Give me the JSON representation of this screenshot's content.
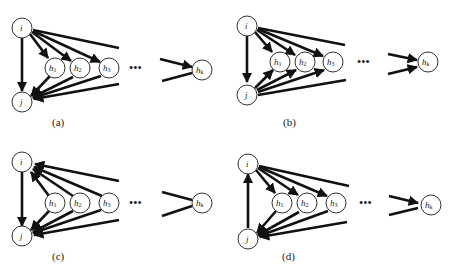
{
  "figure": {
    "panels": [
      {
        "id": "a",
        "caption": "(a)",
        "nodes": {
          "i": "i",
          "j": "j",
          "h1": "h",
          "h2": "h",
          "h3": "h",
          "hk": "h"
        },
        "subscripts": {
          "h1": "1",
          "h2": "2",
          "h3": "3",
          "hk": "k"
        },
        "ellipsis": "•••",
        "description": "i → j, i → h1..hk, h1..hk → j"
      },
      {
        "id": "b",
        "caption": "(b)",
        "nodes": {
          "i": "i",
          "j": "j",
          "h1": "h",
          "h2": "h",
          "h3": "h",
          "hk": "h"
        },
        "subscripts": {
          "h1": "1",
          "h2": "2",
          "h3": "3",
          "hk": "k"
        },
        "ellipsis": "•••",
        "description": "i → j, i → h1..hk, j → h1..hk"
      },
      {
        "id": "c",
        "caption": "(c)",
        "nodes": {
          "i": "i",
          "j": "j",
          "h1": "h",
          "h2": "h",
          "h3": "h",
          "hk": "h"
        },
        "subscripts": {
          "h1": "1",
          "h2": "2",
          "h3": "3",
          "hk": "k"
        },
        "ellipsis": "•••",
        "description": "i → j, h1..hk → i, h1..hk → j"
      },
      {
        "id": "d",
        "caption": "(d)",
        "nodes": {
          "i": "i",
          "j": "j",
          "h1": "h",
          "h2": "h",
          "h3": "h",
          "hk": "h"
        },
        "subscripts": {
          "h1": "1",
          "h2": "2",
          "h3": "3",
          "hk": "k"
        },
        "ellipsis": "•••",
        "description": "j → i, i → h1..hk, h1..hk → j"
      }
    ]
  }
}
